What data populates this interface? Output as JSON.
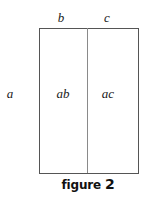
{
  "diagram": {
    "top_labels": {
      "left": "b",
      "right": "c"
    },
    "side_label": "a",
    "regions": {
      "left": "ab",
      "right": "ac"
    },
    "caption": {
      "word": "figure",
      "number": "2"
    },
    "colors": {
      "border": "#555555",
      "divider": "#8a8a8a",
      "text": "#1a1a1a"
    }
  }
}
